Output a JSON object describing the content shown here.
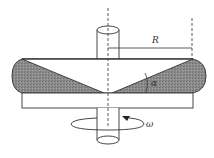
{
  "diagram": {
    "labels": {
      "radius": "R",
      "angle": "α",
      "angular_velocity": "ω"
    },
    "colors": {
      "stroke": "#333333",
      "shaded": "#8a8a8a",
      "background": "#ffffff"
    }
  }
}
